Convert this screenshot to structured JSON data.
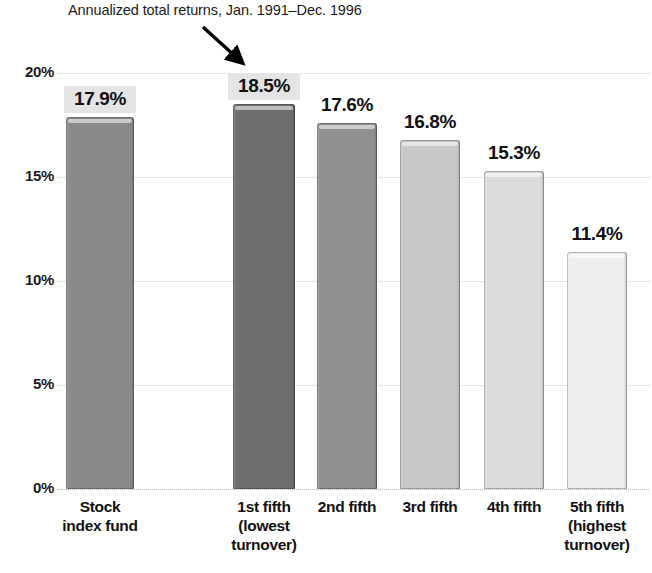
{
  "header": {
    "title_clipped": "",
    "subtitle": "Annualized total returns, Jan. 1991–Dec. 1996"
  },
  "annotation": {
    "arrow_name": "arrow-pointing-to-1st-fifth"
  },
  "chart_data": {
    "type": "bar",
    "title": "",
    "subtitle": "Annualized total returns, Jan. 1991–Dec. 1996",
    "xlabel": "",
    "ylabel": "",
    "ylim": [
      0,
      20
    ],
    "ytick_labels": [
      "20%",
      "15%",
      "10%",
      "5%",
      "0%"
    ],
    "ytick_values": [
      20,
      15,
      10,
      5,
      0
    ],
    "grid": true,
    "legend": "none",
    "categories": [
      "Stock\nindex fund",
      "1st fifth\n(lowest\nturnover)",
      "2nd fifth",
      "3rd fifth",
      "4th fifth",
      "5th fifth\n(highest\nturnover)"
    ],
    "values": [
      17.9,
      18.5,
      17.6,
      16.8,
      15.3,
      11.4
    ],
    "value_labels": [
      "17.9%",
      "18.5%",
      "17.6%",
      "16.8%",
      "15.3%",
      "11.4%"
    ],
    "bar_colors": [
      "#8a8a8a",
      "#6e6e6e",
      "#909090",
      "#c8c8c8",
      "#dcdcdc",
      "#eeeeee"
    ],
    "highlighted_labels": [
      true,
      true,
      false,
      false,
      false,
      false
    ],
    "highlight_color": "#e4e4e4"
  }
}
